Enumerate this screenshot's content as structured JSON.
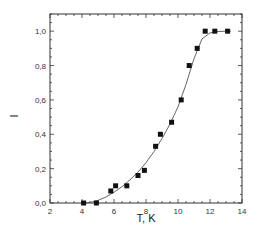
{
  "chart_data": {
    "type": "scatter",
    "title": "",
    "xlabel": "T, K",
    "ylabel": "I",
    "xlim": [
      2,
      14
    ],
    "ylim": [
      0,
      1.1
    ],
    "xticks": [
      2,
      4,
      6,
      8,
      10,
      12,
      14
    ],
    "xtick_labels": [
      "2",
      "4",
      "6",
      "8",
      "10",
      "12",
      "14"
    ],
    "yticks": [
      0,
      0.2,
      0.4,
      0.6,
      0.8,
      1.0
    ],
    "ytick_labels": [
      "0,0",
      "0,2",
      "0,4",
      "0,6",
      "0,8",
      "1,0"
    ],
    "grid": false,
    "legend": null,
    "series": [
      {
        "name": "data",
        "marker": "square",
        "color": "#111111",
        "x": [
          4.1,
          4.9,
          5.8,
          6.1,
          6.8,
          7.5,
          7.9,
          8.6,
          8.9,
          9.6,
          10.2,
          10.7,
          11.2,
          11.7,
          12.3,
          13.1
        ],
        "y": [
          0.0,
          0.0,
          0.07,
          0.1,
          0.1,
          0.16,
          0.19,
          0.33,
          0.4,
          0.47,
          0.6,
          0.8,
          0.9,
          1.0,
          1.0,
          1.0
        ]
      },
      {
        "name": "fit",
        "style": "line",
        "color": "#555555",
        "x": [
          4.0,
          4.5,
          5.0,
          5.5,
          6.0,
          6.5,
          7.0,
          7.5,
          8.0,
          8.5,
          9.0,
          9.5,
          10.0,
          10.5,
          11.0,
          11.5,
          12.0,
          12.5,
          13.0,
          13.3
        ],
        "y": [
          0.0,
          0.003,
          0.015,
          0.035,
          0.063,
          0.095,
          0.135,
          0.18,
          0.235,
          0.3,
          0.375,
          0.46,
          0.56,
          0.69,
          0.84,
          0.955,
          0.99,
          0.998,
          1.0,
          1.0
        ]
      }
    ]
  }
}
